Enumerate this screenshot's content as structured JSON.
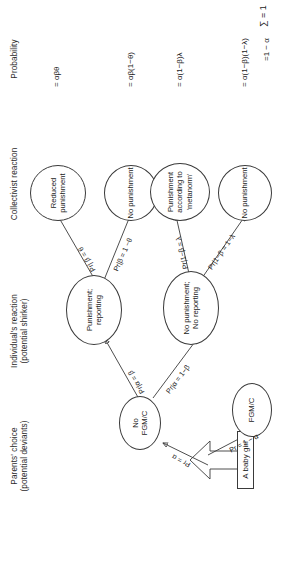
{
  "figure": {
    "title_columns": [
      {
        "id": "parents-choice",
        "label": "Parents' choice\n(potential deviants)"
      },
      {
        "id": "individuals-reaction",
        "label": "Individual's reaction\n(potential shirker)"
      },
      {
        "id": "collectivist-reaction",
        "label": "Collectivist reaction"
      },
      {
        "id": "probability",
        "label": "Probability"
      }
    ],
    "start": {
      "label": "A baby girl",
      "arrow": "up-arrow"
    },
    "nodes": {
      "no_fgmc": "No\nFGM/C",
      "fgmc": "FGM/C",
      "punishment_reporting": "Punishment;\nreporting",
      "no_punishment_no_reporting": "No punishment;\nNo reporting",
      "reduced_punishment": "Reduced\npunishment",
      "no_punishment_1": "No punishment",
      "punishment_metanorm": "Punishment\naccording to\n'metanorm'",
      "no_punishment_2": "No punishment"
    },
    "edges": [
      {
        "id": "start-to-no-fgmc",
        "label": "Pr = α"
      },
      {
        "id": "start-to-fgmc",
        "label": "Pr = 1 − α"
      },
      {
        "id": "no-fgmc-to-punishment",
        "label": "Pr|α = β"
      },
      {
        "id": "no-fgmc-to-no-punishment",
        "label": "Pr|α = 1−β"
      },
      {
        "id": "punishment-to-reduced",
        "label": "Pr| β = θ"
      },
      {
        "id": "punishment-to-nopun",
        "label": "Pr|β = 1 −θ"
      },
      {
        "id": "nopun-to-metanorm",
        "label": "Pr|1−β = λ"
      },
      {
        "id": "nopun-to-nopun2",
        "label": "Pr|1−β = 1−λ"
      }
    ],
    "probabilities": [
      {
        "id": "p-reduced-punishment",
        "value": "= αβθ"
      },
      {
        "id": "p-no-punishment-1",
        "value": "= αβ(1−θ)"
      },
      {
        "id": "p-punishment-metanorm",
        "value": "= α(1−β)λ"
      },
      {
        "id": "p-no-punishment-2",
        "value": "= α(1−β)(1−λ)"
      },
      {
        "id": "p-fgmc",
        "value": "=1 − α"
      }
    ],
    "sum": "∑ = 1"
  }
}
